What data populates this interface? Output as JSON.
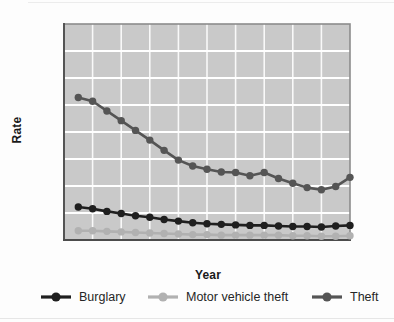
{
  "chart_data": {
    "type": "line",
    "title": "",
    "xlabel": "Year",
    "ylabel": "Rate",
    "x": [
      1993,
      1994,
      1995,
      1996,
      1997,
      1998,
      1999,
      2000,
      2001,
      2002,
      2003,
      2004,
      2005,
      2006,
      2007,
      2008,
      2009,
      2010,
      2011,
      2012
    ],
    "series": [
      {
        "name": "Burglary",
        "color": "#1f1f1f",
        "values": [
          61,
          58,
          53,
          49,
          45,
          42,
          38,
          35,
          32,
          30,
          29,
          28,
          27,
          27,
          26,
          25,
          25,
          24,
          26,
          27
        ]
      },
      {
        "name": "Motor vehicle theft",
        "color": "#b1b1b1",
        "values": [
          17,
          17,
          16,
          15,
          14,
          13,
          12,
          11,
          10,
          10,
          9,
          9,
          9,
          9,
          9,
          8,
          8,
          7,
          7,
          8
        ]
      },
      {
        "name": "Theft",
        "color": "#555555",
        "values": [
          264,
          257,
          239,
          221,
          203,
          185,
          166,
          148,
          137,
          131,
          126,
          125,
          119,
          125,
          114,
          105,
          97,
          93,
          99,
          116
        ]
      }
    ],
    "xlim": [
      1992,
      2012
    ],
    "ylim": [
      0,
      400
    ],
    "x_ticks": [
      1992,
      1996,
      2000,
      2004,
      2008,
      2012
    ],
    "y_ticks": [
      50,
      100,
      150,
      200,
      250,
      300,
      350,
      400
    ],
    "x_gridline_step_years": 2,
    "grid": true,
    "legend_position": "bottom",
    "colors": {
      "plot_bg": "#c9c9c9",
      "grid": "#ffffff",
      "frame": "#8c8c8c",
      "axis": "#4c4c4c",
      "tick_text": "#1a1a1a"
    }
  }
}
